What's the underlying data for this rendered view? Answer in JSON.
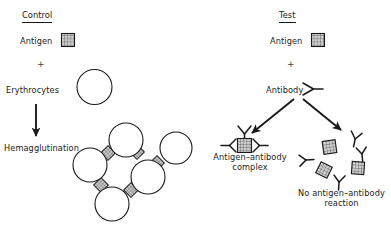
{
  "figure": {
    "type": "diagram",
    "width": 391,
    "height": 229,
    "background": "#ffffff",
    "ink": "#1a1a1a",
    "antigen_fill": "#c9c9c9"
  },
  "control": {
    "heading": "Control",
    "antigen_label": "Antigen",
    "plus": "+",
    "erythrocytes_label": "Erythrocytes",
    "outcome_label": "Hemagglutination",
    "lattice": {
      "cells": 6,
      "antigen_bridges": 5
    }
  },
  "test": {
    "heading": "Test",
    "antigen_label": "Antigen",
    "plus": "+",
    "antibody_label": "Antibody",
    "outcome_left_line1": "Antigen–antibody",
    "outcome_left_line2": "complex",
    "outcome_right_line1": "No antigen–antibody",
    "outcome_right_line2": "reaction",
    "complex": {
      "antibodies": 3,
      "antigens": 1
    },
    "no_reaction": {
      "antigens": 3,
      "antibodies": 4
    }
  }
}
